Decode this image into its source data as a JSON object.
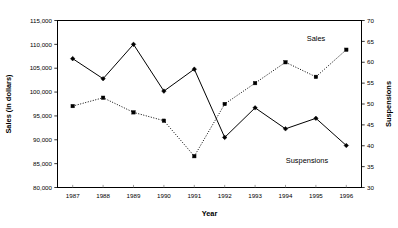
{
  "chart_data": {
    "type": "line",
    "title": "",
    "xlabel": "Year",
    "ylabel": "Sales (in dollars)",
    "y2label": "Suspensions",
    "grid": false,
    "legend_position": "inline-annotation",
    "categories": [
      "1987",
      "1988",
      "1989",
      "1990",
      "1991",
      "1992",
      "1993",
      "1994",
      "1995",
      "1996"
    ],
    "ylim": [
      80000,
      115000
    ],
    "ytick_labels": [
      "80,000",
      "85,000",
      "90,000",
      "95,000",
      "100,000",
      "105,000",
      "110,000",
      "115,000"
    ],
    "ytick_values": [
      80000,
      85000,
      90000,
      95000,
      100000,
      105000,
      110000,
      115000
    ],
    "y2lim": [
      30,
      70
    ],
    "y2tick_labels": [
      "30",
      "35",
      "40",
      "45",
      "50",
      "55",
      "60",
      "65",
      "70"
    ],
    "y2tick_values": [
      30,
      35,
      40,
      45,
      50,
      55,
      60,
      65,
      70
    ],
    "series": [
      {
        "name": "Sales",
        "axis": "left",
        "style": "solid",
        "marker": "filled-diamond",
        "label_text": "Suspensions",
        "values": [
          107000,
          102800,
          110000,
          100200,
          104800,
          90500,
          96700,
          92300,
          94500,
          88800
        ]
      },
      {
        "name": "Suspensions",
        "axis": "right",
        "style": "dotted",
        "marker": "filled-square",
        "label_text": "Sales",
        "values": [
          49.5,
          51.5,
          48.0,
          46.0,
          37.5,
          50.0,
          55.0,
          60.0,
          56.5,
          63.0
        ]
      }
    ],
    "annotations": [
      {
        "text": "Sales",
        "x_px": 316,
        "y_px": 41
      },
      {
        "text": "Suspensions",
        "x_px": 307,
        "y_px": 163
      }
    ],
    "colors": {
      "axis": "#000000",
      "series_solid": "#000000",
      "series_dotted": "#000000",
      "background": "#ffffff"
    }
  }
}
